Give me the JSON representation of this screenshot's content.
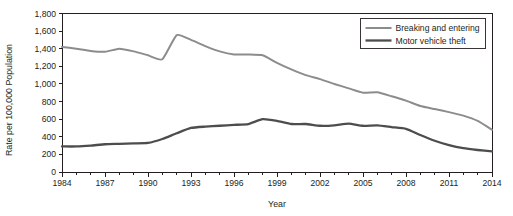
{
  "chart_data": {
    "type": "line",
    "title": "",
    "xlabel": "Year",
    "ylabel": "Rate per 100,000 Population",
    "xlim": [
      1984,
      2014
    ],
    "ylim": [
      0,
      1800
    ],
    "ytick_step": 200,
    "xtick_step": 1,
    "xlabel_step": 3,
    "grid": false,
    "legend_position": "top-right",
    "yticks": [
      "0",
      "200",
      "400",
      "600",
      "800",
      "1,000",
      "1,200",
      "1,400",
      "1,600",
      "1,800"
    ],
    "ytick_values": [
      0,
      200,
      400,
      600,
      800,
      1000,
      1200,
      1400,
      1600,
      1800
    ],
    "xticks": [
      "1984",
      "1987",
      "1990",
      "1993",
      "1996",
      "1999",
      "2002",
      "2005",
      "2008",
      "2011",
      "2014"
    ],
    "xtick_values": [
      1984,
      1987,
      1990,
      1993,
      1996,
      1999,
      2002,
      2005,
      2008,
      2011,
      2014
    ],
    "x": [
      1984,
      1985,
      1986,
      1987,
      1988,
      1989,
      1990,
      1991,
      1992,
      1993,
      1994,
      1995,
      1996,
      1997,
      1998,
      1999,
      2000,
      2001,
      2002,
      2003,
      2004,
      2005,
      2006,
      2007,
      2008,
      2009,
      2010,
      2011,
      2012,
      2013,
      2014
    ],
    "series": [
      {
        "name": "Breaking and entering",
        "color": "#8c8c8c",
        "width": 2.0,
        "values": [
          1420,
          1400,
          1375,
          1365,
          1400,
          1370,
          1325,
          1280,
          1555,
          1500,
          1430,
          1370,
          1335,
          1335,
          1325,
          1240,
          1165,
          1100,
          1055,
          1000,
          950,
          900,
          905,
          860,
          810,
          750,
          715,
          680,
          640,
          580,
          480
        ]
      },
      {
        "name": "Motor vehicle theft",
        "color": "#4d4d4d",
        "width": 2.3,
        "values": [
          290,
          290,
          300,
          315,
          320,
          325,
          330,
          375,
          440,
          500,
          515,
          525,
          535,
          545,
          600,
          580,
          545,
          545,
          525,
          530,
          550,
          525,
          530,
          510,
          490,
          420,
          355,
          305,
          270,
          250,
          235
        ]
      }
    ]
  },
  "legend": {
    "entries": [
      {
        "label": "Breaking and entering"
      },
      {
        "label": "Motor vehicle theft"
      }
    ]
  },
  "axes": {
    "x_title": "Year",
    "y_title": "Rate per 100,000 Population"
  }
}
